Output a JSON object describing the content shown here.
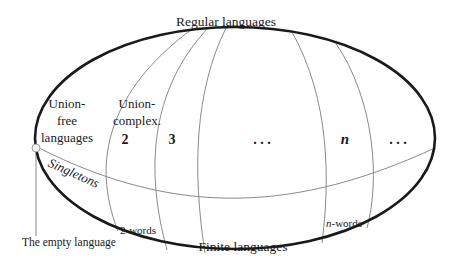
{
  "diagram": {
    "title": "Regular languages",
    "bottom_label": "Finite languages",
    "regions": {
      "union_free": [
        "Union-",
        "free",
        "languages"
      ],
      "union_complex": [
        "Union-",
        "complex."
      ],
      "col_2": "2",
      "col_3": "3",
      "ellipsis_1": ". . .",
      "col_n": "n",
      "ellipsis_2": ". . ."
    },
    "singletons": "Singletons",
    "two_words": "2-words",
    "n_words_italic": "n",
    "n_words_rest": "-words",
    "empty_language": "The empty language"
  }
}
